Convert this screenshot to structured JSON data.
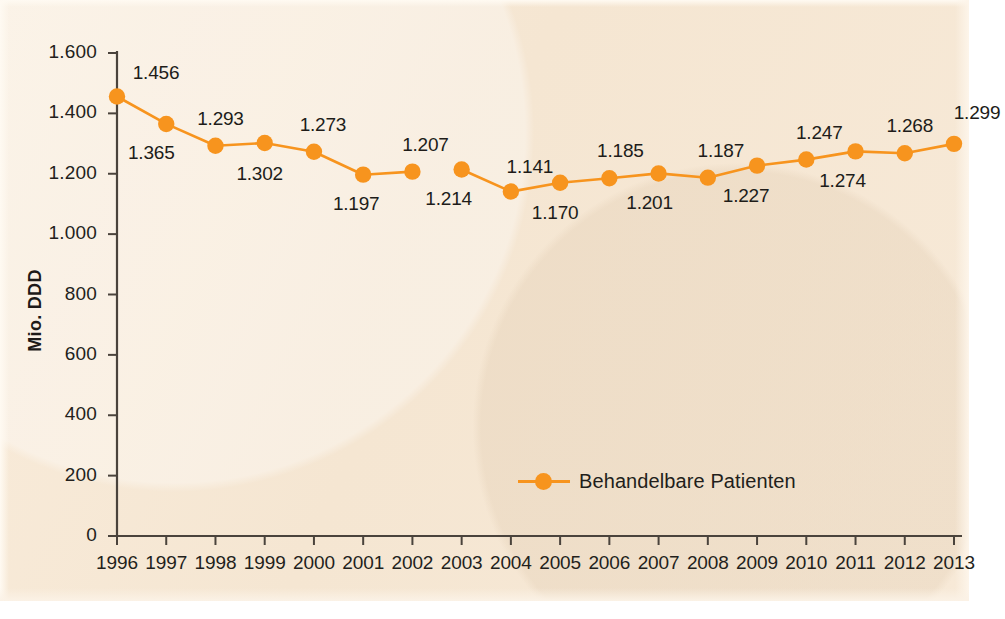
{
  "chart_data": {
    "type": "line",
    "title": "",
    "subtitle": "",
    "xlabel": "",
    "ylabel": "Mio. DDD",
    "ylim": [
      0,
      1600
    ],
    "xlim_categories": [
      "1996",
      "1997",
      "1998",
      "1999",
      "2000",
      "2001",
      "2002",
      "2003",
      "2004",
      "2005",
      "2006",
      "2007",
      "2008",
      "2009",
      "2010",
      "2011",
      "2012",
      "2013"
    ],
    "yticks": [
      "0",
      "200",
      "400",
      "600",
      "800",
      "1.000",
      "1.200",
      "1.400",
      "1.600"
    ],
    "ytick_values": [
      0,
      200,
      400,
      600,
      800,
      1000,
      1200,
      1400,
      1600
    ],
    "grid": false,
    "legend_position": "inside-bottom-center",
    "series": [
      {
        "name": "Behandelbare Patienten",
        "color": "#F7941E",
        "marker": "circle",
        "line_break_after_category": "2002",
        "categories": [
          "1996",
          "1997",
          "1998",
          "1999",
          "2000",
          "2001",
          "2002",
          "2003",
          "2004",
          "2005",
          "2006",
          "2007",
          "2008",
          "2009",
          "2010",
          "2011",
          "2012",
          "2013"
        ],
        "values": [
          1456,
          1365,
          1293,
          1302,
          1273,
          1197,
          1207,
          1214,
          1141,
          1170,
          1185,
          1201,
          1187,
          1227,
          1247,
          1274,
          1268,
          1299
        ],
        "labels": [
          "1.456",
          "1.365",
          "1.293",
          "1.302",
          "1.273",
          "1.197",
          "1.207",
          "1.214",
          "1.141",
          "1.170",
          "1.185",
          "1.201",
          "1.187",
          "1.227",
          "1.247",
          "1.274",
          "1.268",
          "1.299"
        ],
        "label_positions": [
          "above",
          "below",
          "above",
          "below",
          "above",
          "below",
          "above",
          "below",
          "above",
          "below",
          "above",
          "below",
          "above",
          "below",
          "above",
          "below",
          "above",
          "above"
        ]
      }
    ]
  },
  "axes": {
    "y_title": "Mio. DDD",
    "y_ticks": [
      "1.600",
      "1.400",
      "1.200",
      "1.000",
      "800",
      "600",
      "400",
      "200",
      "0"
    ],
    "x_ticks": [
      "1996",
      "1997",
      "1998",
      "1999",
      "2000",
      "2001",
      "2002",
      "2003",
      "2004",
      "2005",
      "2006",
      "2007",
      "2008",
      "2009",
      "2010",
      "2011",
      "2012",
      "2013"
    ]
  },
  "legend": {
    "items": [
      {
        "label": "Behandelbare Patienten",
        "color": "#F7941E"
      }
    ]
  },
  "colors": {
    "background": "#f7e9d6",
    "series": "#F7941E",
    "axis": "#4a433c",
    "text": "#231f1c"
  }
}
